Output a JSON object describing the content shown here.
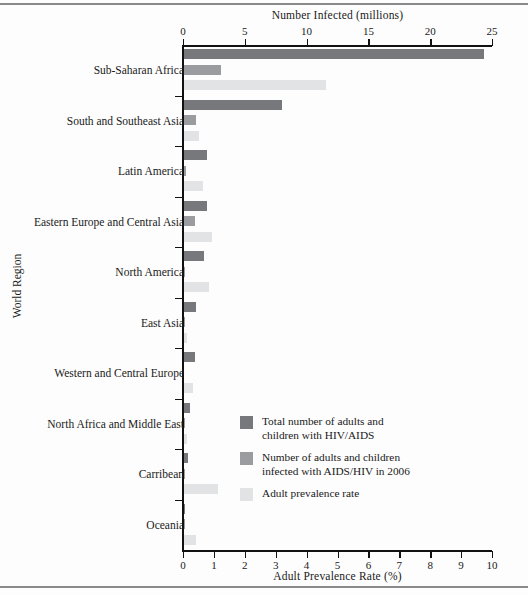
{
  "chart_data": {
    "type": "bar",
    "orientation": "horizontal",
    "title": "",
    "top_axis": {
      "label": "Number Infected (millions)",
      "ticks": [
        0,
        5,
        10,
        15,
        20,
        25
      ],
      "lim": [
        0,
        25
      ]
    },
    "bottom_axis": {
      "label": "Adult Prevalence Rate (%)",
      "ticks": [
        0,
        1,
        2,
        3,
        4,
        5,
        6,
        7,
        8,
        9,
        10
      ],
      "lim": [
        0,
        10
      ]
    },
    "ylabel": "World Region",
    "categories": [
      "Sub-Saharan Africa",
      "South and Southeast Asia",
      "Latin America",
      "Eastern Europe and Central Asia",
      "North America",
      "East Asia",
      "Western and Central Europe",
      "North  Africa and Middle East",
      "Carribean",
      "Oceania"
    ],
    "series": [
      {
        "name": "Total number of adults and children with HIV/AIDS",
        "short_name": "total-infected",
        "color": "#77787b",
        "axis": "top",
        "unit": "millions",
        "values": [
          24.3,
          7.9,
          1.9,
          1.9,
          1.6,
          1.0,
          0.9,
          0.5,
          0.3,
          0.08
        ]
      },
      {
        "name": "Number of adults and children infected with AIDS/HIV in 2006",
        "short_name": "new-infections-2006",
        "color": "#9b9c9f",
        "axis": "top",
        "unit": "millions",
        "values": [
          3.0,
          1.0,
          0.2,
          0.9,
          0.1,
          0.1,
          0.0,
          0.07,
          0.03,
          0.01
        ]
      },
      {
        "name": "Adult prevalence rate",
        "short_name": "adult-prevalence-rate",
        "color": "#e2e3e5",
        "axis": "bottom",
        "unit": "percent",
        "values": [
          4.6,
          0.5,
          0.6,
          0.9,
          0.8,
          0.1,
          0.3,
          0.1,
          1.1,
          0.4
        ]
      }
    ],
    "legend": {
      "position": "inside-lower-right",
      "entries": [
        {
          "color": "#77787b",
          "lines": [
            "Total number of adults and",
            "children with HIV/AIDS"
          ]
        },
        {
          "color": "#9b9c9f",
          "lines": [
            "Number of adults and children",
            "infected with AIDS/HIV in 2006"
          ]
        },
        {
          "color": "#e2e3e5",
          "lines": [
            "Adult prevalence rate"
          ]
        }
      ]
    },
    "grid": false
  }
}
